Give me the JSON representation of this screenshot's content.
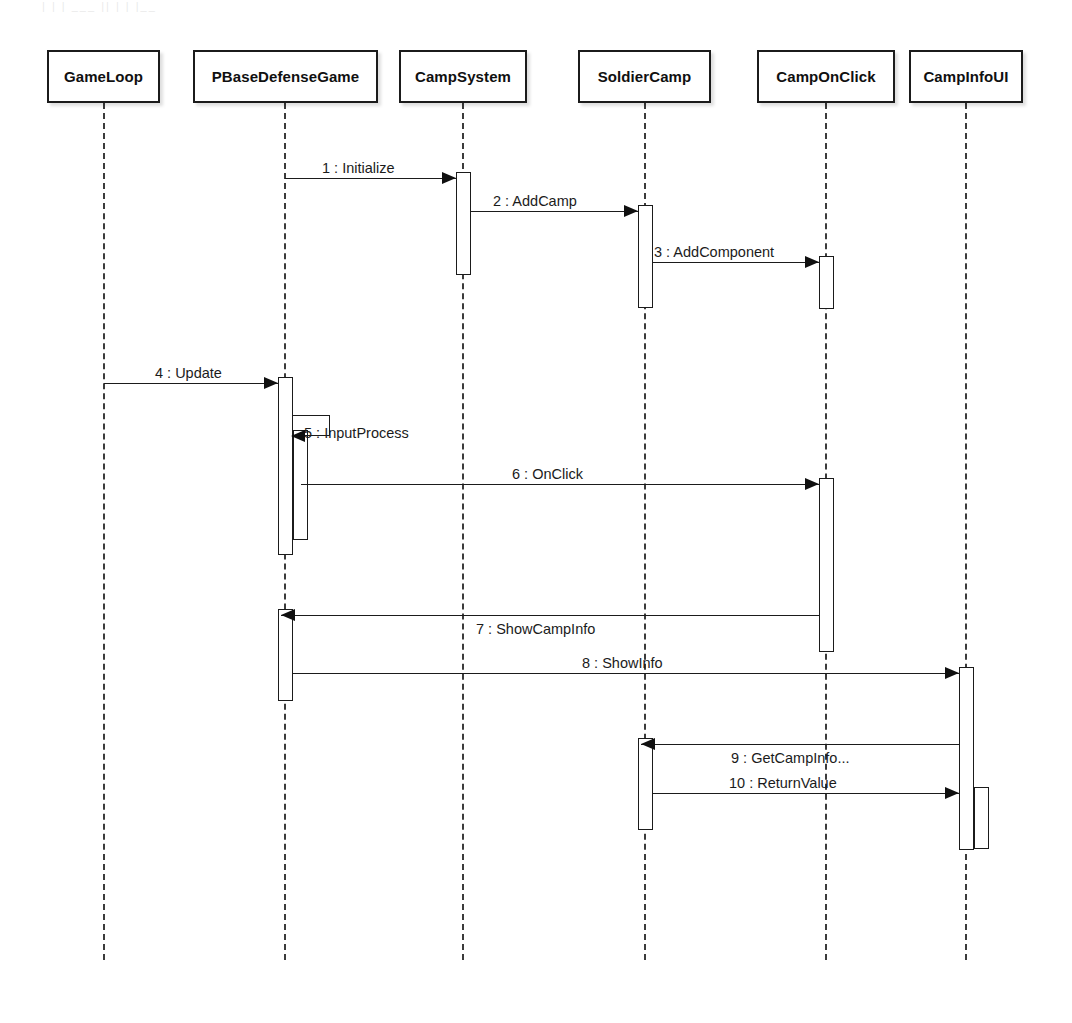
{
  "diagram": {
    "kind": "uml-sequence-diagram",
    "title_artifact": "|  |  |  ___  ||  |  |  |__",
    "width": 1072,
    "height": 1023,
    "colors": {
      "stroke": "#1b1b1b",
      "lifeline": "#3c3c3c",
      "background": "#ffffff",
      "text": "#101010"
    }
  },
  "participants": [
    {
      "id": "gameloop",
      "label": "GameLoop",
      "box_x": 47,
      "box_y": 50,
      "box_w": 113,
      "box_h": 53,
      "lifeline_x": 104,
      "lifeline_bottom": 960
    },
    {
      "id": "pbasedefensegame",
      "label": "PBaseDefenseGame",
      "box_x": 193,
      "box_y": 50,
      "box_w": 185,
      "box_h": 53,
      "lifeline_x": 285,
      "lifeline_bottom": 960
    },
    {
      "id": "campsystem",
      "label": "CampSystem",
      "box_x": 399,
      "box_y": 50,
      "box_w": 128,
      "box_h": 53,
      "lifeline_x": 463,
      "lifeline_bottom": 960
    },
    {
      "id": "soldiercamp",
      "label": "SoldierCamp",
      "box_x": 578,
      "box_y": 50,
      "box_w": 133,
      "box_h": 53,
      "lifeline_x": 645,
      "lifeline_bottom": 960
    },
    {
      "id": "camponclick",
      "label": "CampOnClick",
      "box_x": 757,
      "box_y": 50,
      "box_w": 138,
      "box_h": 53,
      "lifeline_x": 826,
      "lifeline_bottom": 960
    },
    {
      "id": "campinfoui",
      "label": "CampInfoUI",
      "box_x": 909,
      "box_y": 50,
      "box_w": 114,
      "box_h": 53,
      "lifeline_x": 966,
      "lifeline_bottom": 960
    }
  ],
  "messages": [
    {
      "seq": "1",
      "name": "Initialize",
      "label": "1 : Initialize",
      "from": "pbasedefensegame",
      "to": "campsystem",
      "y": 178,
      "direction": "right",
      "kind": "call",
      "x1": 285,
      "x2": 456,
      "label_x": 322,
      "label_y": 160
    },
    {
      "seq": "2",
      "name": "AddCamp",
      "label": "2 : AddCamp",
      "from": "campsystem",
      "to": "soldiercamp",
      "y": 211,
      "direction": "right",
      "kind": "call",
      "x1": 471,
      "x2": 638,
      "label_x": 493,
      "label_y": 193
    },
    {
      "seq": "3",
      "name": "AddComponent",
      "label": "3 : AddComponent",
      "from": "soldiercamp",
      "to": "camponclick",
      "y": 262,
      "direction": "right",
      "kind": "call",
      "x1": 653,
      "x2": 819,
      "label_x": 654,
      "label_y": 244
    },
    {
      "seq": "4",
      "name": "Update",
      "label": "4 : Update",
      "from": "gameloop",
      "to": "pbasedefensegame",
      "y": 383,
      "direction": "right",
      "kind": "call",
      "x1": 104,
      "x2": 278,
      "label_x": 155,
      "label_y": 365
    },
    {
      "seq": "5",
      "name": "InputProcess",
      "label": "5 : InputProcess",
      "from": "pbasedefensegame",
      "to": "pbasedefensegame",
      "y": 436,
      "direction": "self",
      "kind": "call",
      "x1": 293,
      "x2": 330,
      "label_x": 304,
      "label_y": 425
    },
    {
      "seq": "6",
      "name": "OnClick",
      "label": "6 : OnClick",
      "from": "pbasedefensegame",
      "to": "camponclick",
      "y": 484,
      "direction": "right",
      "kind": "call",
      "x1": 301,
      "x2": 819,
      "label_x": 512,
      "label_y": 466
    },
    {
      "seq": "7",
      "name": "ShowCampInfo",
      "label": "7 : ShowCampInfo",
      "from": "camponclick",
      "to": "pbasedefensegame",
      "y": 615,
      "direction": "left",
      "kind": "return",
      "x1": 281,
      "x2": 819,
      "label_x": 476,
      "label_y": 621
    },
    {
      "seq": "8",
      "name": "ShowInfo",
      "label": "8 : ShowInfo",
      "from": "pbasedefensegame",
      "to": "campinfoui",
      "y": 673,
      "direction": "right",
      "kind": "call",
      "x1": 293,
      "x2": 959,
      "label_x": 582,
      "label_y": 655
    },
    {
      "seq": "9",
      "name": "GetCampInfo...",
      "label": "9 : GetCampInfo...",
      "from": "campinfoui",
      "to": "soldiercamp",
      "y": 744,
      "direction": "left",
      "kind": "return",
      "x1": 641,
      "x2": 959,
      "label_x": 731,
      "label_y": 750
    },
    {
      "seq": "10",
      "name": "ReturnValue",
      "label": "10 : ReturnValue",
      "from": "soldiercamp",
      "to": "campinfoui",
      "y": 793,
      "direction": "right",
      "kind": "call",
      "x1": 653,
      "x2": 959,
      "label_x": 729,
      "label_y": 775
    }
  ],
  "activations": [
    {
      "id": "act-campsystem-1",
      "on": "campsystem",
      "x": 456,
      "y": 172,
      "w": 15,
      "h": 103
    },
    {
      "id": "act-soldiercamp-1",
      "on": "soldiercamp",
      "x": 638,
      "y": 205,
      "w": 15,
      "h": 103
    },
    {
      "id": "act-camponclick-1",
      "on": "camponclick",
      "x": 819,
      "y": 256,
      "w": 15,
      "h": 53
    },
    {
      "id": "act-pbase-1",
      "on": "pbasedefensegame",
      "x": 278,
      "y": 377,
      "w": 15,
      "h": 178
    },
    {
      "id": "act-pbase-2",
      "on": "pbasedefensegame",
      "x": 293,
      "y": 430,
      "w": 15,
      "h": 110
    },
    {
      "id": "act-camponclick-2",
      "on": "camponclick",
      "x": 819,
      "y": 478,
      "w": 15,
      "h": 174
    },
    {
      "id": "act-pbase-3",
      "on": "pbasedefensegame",
      "x": 278,
      "y": 609,
      "w": 15,
      "h": 92
    },
    {
      "id": "act-campinfoui-1",
      "on": "campinfoui",
      "x": 959,
      "y": 667,
      "w": 15,
      "h": 183
    },
    {
      "id": "act-soldiercamp-2",
      "on": "soldiercamp",
      "x": 638,
      "y": 738,
      "w": 15,
      "h": 92
    },
    {
      "id": "act-campinfoui-2",
      "on": "campinfoui",
      "x": 974,
      "y": 787,
      "w": 15,
      "h": 62
    }
  ]
}
